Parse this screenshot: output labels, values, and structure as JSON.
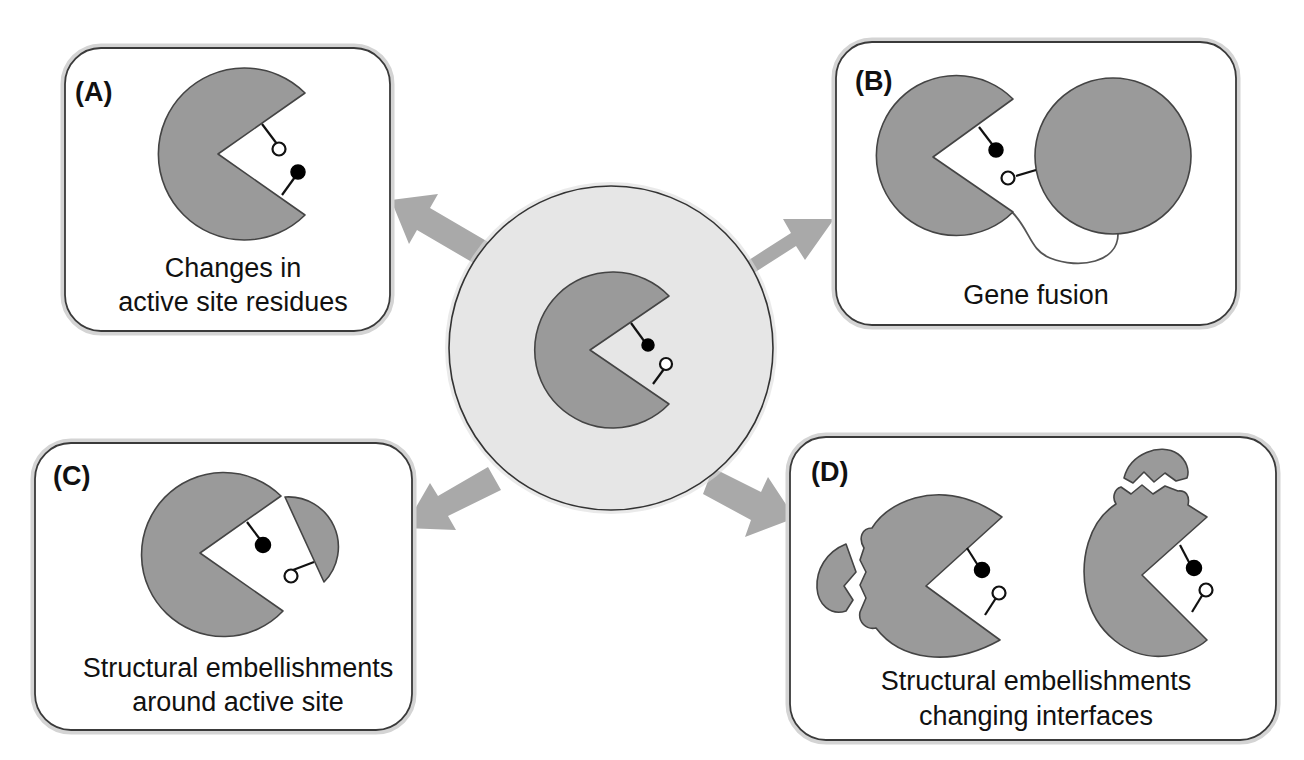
{
  "figure": {
    "center": {
      "description": "ancestral enzyme with two active site residues",
      "circle_fill": "#e6e6e6"
    },
    "panels": [
      {
        "id": "A",
        "label": "(A)",
        "caption_lines": [
          "Changes in",
          "active site residues"
        ]
      },
      {
        "id": "B",
        "label": "(B)",
        "caption_lines": [
          "Gene fusion"
        ]
      },
      {
        "id": "C",
        "label": "(C)",
        "caption_lines": [
          "Structural embellishments",
          "around active site"
        ]
      },
      {
        "id": "D",
        "label": "(D)",
        "caption_lines": [
          "Structural embellishments",
          "changing interfaces"
        ]
      }
    ],
    "colors": {
      "enzyme_fill": "#9a9a9a",
      "enzyme_stroke": "#444444",
      "arrow_fill": "#a9a9a9",
      "box_border": "#3a3a3a",
      "box_shadow": "#d4d4d4",
      "center_circle": "#e6e6e6"
    }
  }
}
